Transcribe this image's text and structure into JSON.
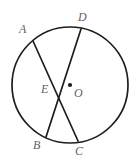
{
  "figure": {
    "type": "circle-with-intersecting-chords",
    "background_color": "#ffffff",
    "stroke_color": "#1d1d1f",
    "label_color": "#5f5f63",
    "circle": {
      "center_label": "O",
      "center_x": 70,
      "center_y": 85,
      "radius": 58,
      "center_dot_radius": 2.1
    },
    "points": [
      {
        "id": "A",
        "label": "A",
        "x": 33,
        "y": 41,
        "on": "circle"
      },
      {
        "id": "D",
        "label": "D",
        "x": 81,
        "y": 29,
        "on": "circle"
      },
      {
        "id": "B",
        "label": "B",
        "x": 46,
        "y": 137,
        "on": "circle"
      },
      {
        "id": "C",
        "label": "C",
        "x": 78,
        "y": 141,
        "on": "circle"
      },
      {
        "id": "E",
        "label": "E",
        "x": 57,
        "y": 88,
        "on": "chord-intersection"
      },
      {
        "id": "O",
        "label": "O",
        "x": 70,
        "y": 85,
        "on": "center"
      }
    ],
    "chords": [
      {
        "id": "AC",
        "from": "A",
        "to": "C",
        "label": "A to C"
      },
      {
        "id": "DB",
        "from": "D",
        "to": "B",
        "label": "D to B"
      }
    ],
    "labels": {
      "A": "A",
      "B": "B",
      "C": "C",
      "D": "D",
      "E": "E",
      "O": "O"
    }
  }
}
